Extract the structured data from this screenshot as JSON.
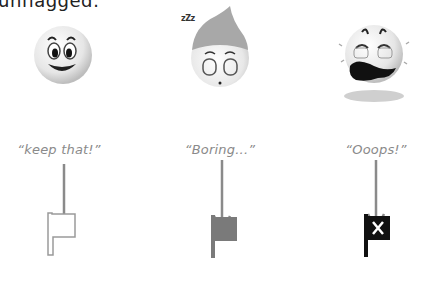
{
  "header": {
    "text": "unflagged:"
  },
  "columns": [
    {
      "id": "keep",
      "face": "happy-face-icon",
      "caption": "“keep that!”",
      "flag": {
        "style": "outline",
        "icon": "outline-flag-icon",
        "color": "#ffffff",
        "stroke": "#9a9a9a"
      }
    },
    {
      "id": "boring",
      "face": "sleeping-face-icon",
      "decoration": "zZz",
      "caption": "“Boring...”",
      "flag": {
        "style": "filled",
        "icon": "gray-flag-icon",
        "color": "#7a7a7a"
      }
    },
    {
      "id": "oops",
      "face": "crying-face-icon",
      "caption": "“Ooops!”",
      "flag": {
        "style": "filled-x",
        "icon": "black-x-flag-icon",
        "color": "#111111",
        "mark": "✕"
      }
    }
  ],
  "colors": {
    "arrow": "#8a8a8a",
    "caption": "#8a8a8a"
  }
}
